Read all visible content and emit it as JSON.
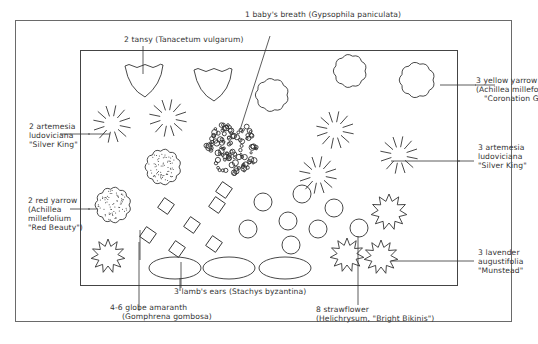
{
  "diagram": {
    "type": "garden-bed-planting-plan",
    "stroke_color": "#333333",
    "frame_color": "#6a6a6a"
  },
  "labels": {
    "babys_breath": {
      "lines": [
        "1 baby's breath (Gypsophila paniculata)"
      ]
    },
    "tansy": {
      "lines": [
        "2 tansy (Tanacetum vulgarum)"
      ]
    },
    "yellow_yarrow": {
      "lines": [
        "3 yellow yarrow",
        "(Achillea millefolium",
        "\"Coronation Gold\")"
      ]
    },
    "artemesia_left": {
      "lines": [
        "2 artemesia",
        "ludoviciana",
        "\"Silver King\""
      ]
    },
    "artemesia_right": {
      "lines": [
        "3 artemesia",
        "ludoviciana",
        "\"Silver King\""
      ]
    },
    "red_yarrow": {
      "lines": [
        "2 red yarrow",
        "(Achillea",
        "millefolium",
        "\"Red Beauty\")"
      ]
    },
    "lavender": {
      "lines": [
        "3 lavender",
        "augustifolia",
        "\"Munstead\""
      ]
    },
    "lambs_ears": {
      "lines": [
        "3 lamb's ears (Stachys byzantina)"
      ]
    },
    "globe_amaranth": {
      "lines": [
        "4-6 globe amaranth",
        "(Gomphrena gombosa)"
      ]
    },
    "strawflower": {
      "lines": [
        "8 strawflower",
        "(Helichrysum, \"Bright Bikinis\")"
      ]
    }
  },
  "plants": [
    {
      "name": "baby's breath",
      "count": 1,
      "symbol": "bubble-cluster"
    },
    {
      "name": "tansy",
      "count": 2,
      "symbol": "wavy-cup"
    },
    {
      "name": "yellow yarrow",
      "count": 3,
      "symbol": "scalloped-cloud"
    },
    {
      "name": "artemesia ludoviciana (left)",
      "count": 2,
      "symbol": "radiating-dashes"
    },
    {
      "name": "artemesia ludoviciana (right)",
      "count": 3,
      "symbol": "radiating-dashes"
    },
    {
      "name": "red yarrow",
      "count": 2,
      "symbol": "dotted-scalloped-cloud"
    },
    {
      "name": "lavender",
      "count": 3,
      "symbol": "spiky-star"
    },
    {
      "name": "lamb's ears",
      "count": 3,
      "symbol": "ellipse"
    },
    {
      "name": "globe amaranth",
      "count": "4-6",
      "symbol": "diamond"
    },
    {
      "name": "strawflower",
      "count": 8,
      "symbol": "circle"
    }
  ]
}
